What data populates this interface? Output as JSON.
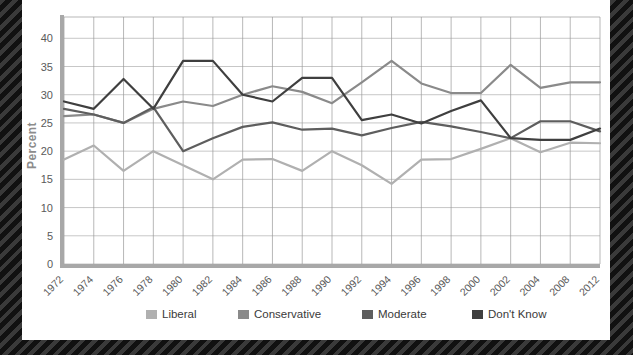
{
  "chart_data": {
    "type": "line",
    "title": "",
    "xlabel": "",
    "ylabel": "Percent",
    "ylim": [
      0,
      42
    ],
    "yticks": [
      0,
      5,
      10,
      15,
      20,
      25,
      30,
      35,
      40
    ],
    "grid": true,
    "legend_position": "bottom",
    "categories": [
      "1972",
      "1974",
      "1976",
      "1978",
      "1980",
      "1982",
      "1984",
      "1986",
      "1988",
      "1990",
      "1992",
      "1994",
      "1996",
      "1998",
      "2000",
      "2002",
      "2004",
      "2008",
      "2012"
    ],
    "series": [
      {
        "name": "Liberal",
        "color": "#b0b0b0",
        "values": [
          18.5,
          21.0,
          16.5,
          20.0,
          17.5,
          15.0,
          18.5,
          18.6,
          16.5,
          20.0,
          17.5,
          14.2,
          18.5,
          18.6,
          20.4,
          22.3,
          19.8,
          21.5,
          21.4
        ]
      },
      {
        "name": "Conservative",
        "color": "#8a8a8a",
        "values": [
          26.2,
          26.5,
          25.0,
          27.5,
          28.8,
          28.0,
          30.0,
          31.5,
          30.5,
          28.5,
          32.2,
          36.0,
          32.0,
          30.3,
          30.3,
          35.3,
          31.2,
          32.2,
          32.2
        ]
      },
      {
        "name": "Moderate",
        "color": "#5e5e5e",
        "values": [
          27.5,
          26.5,
          25.0,
          27.8,
          20.0,
          22.3,
          24.3,
          25.1,
          23.8,
          24.0,
          22.8,
          24.1,
          25.2,
          24.4,
          23.4,
          22.3,
          25.3,
          25.3,
          23.5
        ]
      },
      {
        "name": "Don't Know",
        "color": "#3f3f3f",
        "values": [
          28.8,
          27.5,
          32.8,
          27.5,
          36.0,
          36.0,
          30.0,
          28.8,
          33.0,
          33.0,
          25.5,
          26.5,
          24.9,
          27.1,
          29.0,
          22.3,
          22.0,
          22.0,
          24.0
        ]
      }
    ],
    "legend": [
      {
        "label": "Liberal",
        "color": "#b0b0b0"
      },
      {
        "label": "Conservative",
        "color": "#8a8a8a"
      },
      {
        "label": "Moderate",
        "color": "#5e5e5e"
      },
      {
        "label": "Don't Know",
        "color": "#3f3f3f"
      }
    ]
  }
}
